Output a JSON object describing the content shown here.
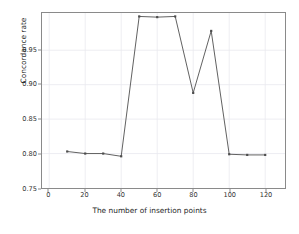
{
  "chart_data": {
    "type": "line",
    "title": "",
    "xlabel": "The number of insertion points",
    "ylabel": "Concordance rate",
    "x": [
      10,
      20,
      30,
      40,
      50,
      60,
      70,
      80,
      90,
      100,
      110,
      120
    ],
    "values": [
      0.803,
      0.8,
      0.8,
      0.796,
      0.999,
      0.998,
      0.999,
      0.888,
      0.978,
      0.799,
      0.798,
      0.798
    ],
    "series": [
      {
        "name": "Concordance rate",
        "values": [
          0.803,
          0.8,
          0.8,
          0.796,
          0.999,
          0.998,
          0.999,
          0.888,
          0.978,
          0.799,
          0.798,
          0.798
        ]
      }
    ],
    "xlim": [
      -4,
      131
    ],
    "ylim": [
      0.75,
      1.004
    ],
    "xticks": [
      0,
      20,
      40,
      60,
      80,
      100,
      120
    ],
    "xtick_labels": [
      "0",
      "20",
      "40",
      "60",
      "80",
      "100",
      "120"
    ],
    "yticks": [
      0.75,
      0.8,
      0.85,
      0.9,
      0.95
    ],
    "ytick_labels": [
      "0.75",
      "0.80",
      "0.85",
      "0.90",
      "0.95"
    ],
    "grid": true,
    "legend": "none",
    "line_color": "#4d4d4d",
    "marker": "point",
    "marker_color": "#4d4d4d",
    "grid_color": "#e8e8ef",
    "spine_color": "#8a8a8a",
    "background_color": "#ffffff"
  }
}
